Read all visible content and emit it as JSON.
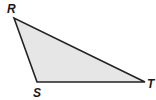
{
  "diagram": {
    "type": "triangle",
    "fill": "#e6e6e6",
    "stroke": "#222222",
    "vertices": [
      {
        "label": "R",
        "x": 14,
        "y": 18,
        "label_x": 7,
        "label_y": 13
      },
      {
        "label": "S",
        "x": 37,
        "y": 82,
        "label_x": 33,
        "label_y": 97
      },
      {
        "label": "T",
        "x": 145,
        "y": 82,
        "label_x": 147,
        "label_y": 88
      }
    ]
  }
}
